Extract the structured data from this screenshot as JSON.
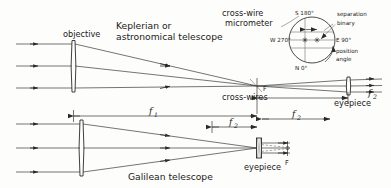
{
  "figure": {
    "title_top": "Keplerian  or",
    "title_top2": "astronomical telescope",
    "title_bottom": "Galilean telescope"
  },
  "labels": {
    "objective": "objective",
    "eyepiece_top": "eyepiece",
    "eyepiece_bottom": "eyepiece",
    "cross_wires": "cross-wires",
    "cross_wire_micrometer_l1": "cross-wire",
    "cross_wire_micrometer_l2": "micrometer",
    "separation": "separation",
    "binary": "binary",
    "position_angle_l1": "position",
    "position_angle_l2": "angle",
    "focus_top": "F",
    "focus_bottom": "F"
  },
  "micrometer": {
    "north": "N 0°",
    "south": "S 180°",
    "east": "E 90°",
    "west": "W 270°"
  },
  "dimensions": {
    "f1": "f",
    "f1_sub": "1",
    "f2_top": "f",
    "f2_top_sub": "2",
    "f2_mid": "f",
    "f2_mid_sub": "2",
    "f2_bottom": "f",
    "f2_bottom_sub": "2"
  },
  "colors": {
    "ink": "#2a2a2a",
    "ray": "#3a3a3a",
    "background": "#fdfdfb"
  }
}
